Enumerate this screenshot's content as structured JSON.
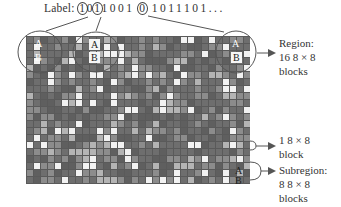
{
  "diagram": {
    "label": {
      "prefix": "Label:",
      "circled_1": "1",
      "mid_1": "0",
      "circled_2": "1",
      "mid_2": "1001",
      "circled_3": "0",
      "tail": "1011101..."
    },
    "grid": {
      "columns": 32,
      "rows": 21,
      "seed": 7,
      "colors": {
        "border": "#5a5a5a",
        "base": "#6e6e6e",
        "light": "#8c8c8c",
        "lighter": "#b4b4b4",
        "white": "#f2f2f2"
      }
    },
    "markers": {
      "a": "A",
      "b": "B"
    },
    "annotations": {
      "region": {
        "line1": "Region:",
        "line2": "16  8 × 8",
        "line3": "blocks"
      },
      "block": {
        "line1": "1  8 × 8",
        "line2": "block"
      },
      "subregion": {
        "line1": "Subregion:",
        "line2": "8  8 × 8",
        "line3": "blocks"
      }
    },
    "line_color": "#555555"
  }
}
